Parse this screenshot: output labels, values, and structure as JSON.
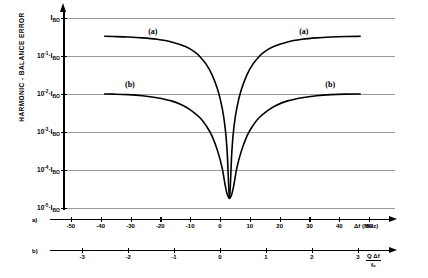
{
  "chart_data": {
    "type": "line",
    "title": "",
    "ylabel": "HARMONIC - BALANCE ERROR",
    "xlabel_a": "Δf (MHz)",
    "xlabel_b_numerator": "Q Δf",
    "xlabel_b_denominator": "f₀",
    "grid": true,
    "legend_position": "inline-annotation",
    "y_axis": {
      "scale": "log",
      "unit_symbol": "I",
      "unit_subscript": "BO",
      "tick_labels": [
        {
          "mantissa": "",
          "exponent": "",
          "sep": "",
          "unit": "I",
          "sub": "BO",
          "value": 1
        },
        {
          "mantissa": "10",
          "exponent": "-1",
          "sep": "·",
          "unit": "I",
          "sub": "BO",
          "value": 0.1
        },
        {
          "mantissa": "10",
          "exponent": "-2",
          "sep": "·",
          "unit": "I",
          "sub": "BO",
          "value": 0.01
        },
        {
          "mantissa": "10",
          "exponent": "-3",
          "sep": "·",
          "unit": "I",
          "sub": "BO",
          "value": 0.001
        },
        {
          "mantissa": "10",
          "exponent": "-4",
          "sep": "·",
          "unit": "I",
          "sub": "BO",
          "value": 0.0001
        },
        {
          "mantissa": "10",
          "exponent": "-5",
          "sep": "·",
          "unit": "I",
          "sub": "BO",
          "value": 1e-05
        }
      ],
      "ylim": [
        1e-05,
        1
      ]
    },
    "x_axis_a": {
      "row_tag": "a)",
      "tick_labels": [
        "-50",
        "-40",
        "-30",
        "-20",
        "-10",
        "0",
        "10",
        "20",
        "30",
        "40",
        "50"
      ],
      "values": [
        -50,
        -40,
        -30,
        -20,
        -10,
        0,
        10,
        20,
        30,
        40,
        50
      ],
      "unit": "MHz",
      "xlim": [
        -57,
        57
      ]
    },
    "x_axis_b": {
      "row_tag": "b)",
      "tick_labels": [
        "-3",
        "-2",
        "-1",
        "0",
        "1",
        "2",
        "3"
      ],
      "values": [
        -3,
        -2,
        -1,
        0,
        1,
        2,
        3
      ],
      "xlim": [
        -3.7,
        3.7
      ]
    },
    "series": [
      {
        "name": "(a)",
        "label": "(a)",
        "label_left_position": {
          "x": -28,
          "y": 0.55
        },
        "label_right_position": {
          "x": 24,
          "y": 0.55
        },
        "points_left": [
          {
            "x": -43,
            "y": 0.33
          },
          {
            "x": -40,
            "y": 0.325
          },
          {
            "x": -35,
            "y": 0.315
          },
          {
            "x": -30,
            "y": 0.3
          },
          {
            "x": -25,
            "y": 0.275
          },
          {
            "x": -20,
            "y": 0.235
          },
          {
            "x": -15,
            "y": 0.175
          },
          {
            "x": -12,
            "y": 0.128
          },
          {
            "x": -10,
            "y": 0.093
          },
          {
            "x": -8,
            "y": 0.06
          },
          {
            "x": -6,
            "y": 0.032
          },
          {
            "x": -4,
            "y": 0.0125
          },
          {
            "x": -2.5,
            "y": 0.0042
          },
          {
            "x": -1.5,
            "y": 0.0013
          },
          {
            "x": -0.8,
            "y": 0.0003
          },
          {
            "x": -0.3,
            "y": 4e-05
          },
          {
            "x": 0,
            "y": 1.8e-05
          }
        ],
        "points_right": [
          {
            "x": 0,
            "y": 1.8e-05
          },
          {
            "x": 0.3,
            "y": 4e-05
          },
          {
            "x": 0.8,
            "y": 0.0003
          },
          {
            "x": 1.5,
            "y": 0.0013
          },
          {
            "x": 2.5,
            "y": 0.0042
          },
          {
            "x": 4,
            "y": 0.0125
          },
          {
            "x": 6,
            "y": 0.032
          },
          {
            "x": 8,
            "y": 0.06
          },
          {
            "x": 10,
            "y": 0.093
          },
          {
            "x": 12,
            "y": 0.128
          },
          {
            "x": 15,
            "y": 0.175
          },
          {
            "x": 20,
            "y": 0.235
          },
          {
            "x": 25,
            "y": 0.275
          },
          {
            "x": 30,
            "y": 0.3
          },
          {
            "x": 35,
            "y": 0.315
          },
          {
            "x": 40,
            "y": 0.325
          },
          {
            "x": 45,
            "y": 0.33
          }
        ]
      },
      {
        "name": "(b)",
        "label": "(b)",
        "label_left_position": {
          "x": -36,
          "y": 0.022
        },
        "label_right_position": {
          "x": 33,
          "y": 0.022
        },
        "points_left": [
          {
            "x": -43,
            "y": 0.01
          },
          {
            "x": -40,
            "y": 0.0099
          },
          {
            "x": -35,
            "y": 0.0096
          },
          {
            "x": -30,
            "y": 0.009
          },
          {
            "x": -25,
            "y": 0.008
          },
          {
            "x": -20,
            "y": 0.0066
          },
          {
            "x": -16,
            "y": 0.005
          },
          {
            "x": -13,
            "y": 0.0036
          },
          {
            "x": -10,
            "y": 0.0023
          },
          {
            "x": -8,
            "y": 0.00145
          },
          {
            "x": -6,
            "y": 0.00078
          },
          {
            "x": -4,
            "y": 0.0003
          },
          {
            "x": -2.5,
            "y": 0.00011
          },
          {
            "x": -1.5,
            "y": 4e-05
          },
          {
            "x": -0.7,
            "y": 2.2e-05
          },
          {
            "x": 0,
            "y": 1.8e-05
          }
        ],
        "points_right": [
          {
            "x": 0,
            "y": 1.8e-05
          },
          {
            "x": 0.7,
            "y": 2.2e-05
          },
          {
            "x": 1.5,
            "y": 4e-05
          },
          {
            "x": 2.5,
            "y": 0.00011
          },
          {
            "x": 4,
            "y": 0.0003
          },
          {
            "x": 6,
            "y": 0.00078
          },
          {
            "x": 8,
            "y": 0.00145
          },
          {
            "x": 10,
            "y": 0.0023
          },
          {
            "x": 13,
            "y": 0.0036
          },
          {
            "x": 16,
            "y": 0.005
          },
          {
            "x": 20,
            "y": 0.0066
          },
          {
            "x": 25,
            "y": 0.008
          },
          {
            "x": 30,
            "y": 0.009
          },
          {
            "x": 35,
            "y": 0.0096
          },
          {
            "x": 40,
            "y": 0.0099
          },
          {
            "x": 45,
            "y": 0.01
          }
        ]
      }
    ]
  }
}
